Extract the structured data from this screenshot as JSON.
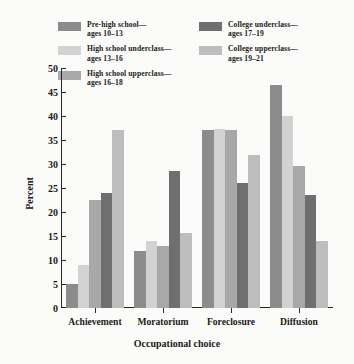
{
  "legend": {
    "entries": [
      {
        "label_line1": "Pre-high school—",
        "label_line2": "ages 10–13",
        "color": "#8c8c8c",
        "column": "left"
      },
      {
        "label_line1": "High school underclass—",
        "label_line2": "ages 13–16",
        "color": "#d2d2d2",
        "column": "left"
      },
      {
        "label_line1": "High school upperclass—",
        "label_line2": "ages 16–18",
        "color": "#a8a8a8",
        "column": "left"
      },
      {
        "label_line1": "College underclass—",
        "label_line2": "ages 17–19",
        "color": "#6f6f6f",
        "column": "right"
      },
      {
        "label_line1": "College upperclass—",
        "label_line2": "ages 19–21",
        "color": "#bdbdbd",
        "column": "right"
      }
    ]
  },
  "chart_data": {
    "type": "bar",
    "title": "",
    "xlabel": "Occupational choice",
    "ylabel": "Percent",
    "ylim": [
      0,
      50
    ],
    "yticks": [
      0,
      5,
      10,
      15,
      20,
      25,
      30,
      35,
      40,
      45,
      50
    ],
    "grid": false,
    "legend_position": "top",
    "categories": [
      "Achievement",
      "Moratorium",
      "Foreclosure",
      "Diffusion"
    ],
    "series": [
      {
        "name": "Pre-high school—ages 10–13",
        "color": "#8c8c8c",
        "values": [
          5.0,
          11.8,
          37.0,
          46.5
        ]
      },
      {
        "name": "High school underclass—ages 13–16",
        "color": "#d2d2d2",
        "values": [
          9.0,
          14.0,
          37.2,
          40.0
        ]
      },
      {
        "name": "High school upperclass—ages 16–18",
        "color": "#a8a8a8",
        "values": [
          22.5,
          13.0,
          37.0,
          29.6
        ]
      },
      {
        "name": "College underclass—ages 17–19",
        "color": "#6f6f6f",
        "values": [
          24.0,
          28.5,
          26.0,
          23.5
        ]
      },
      {
        "name": "College upperclass—ages 19–21",
        "color": "#bdbdbd",
        "values": [
          37.0,
          15.6,
          31.8,
          14.0
        ]
      }
    ]
  }
}
